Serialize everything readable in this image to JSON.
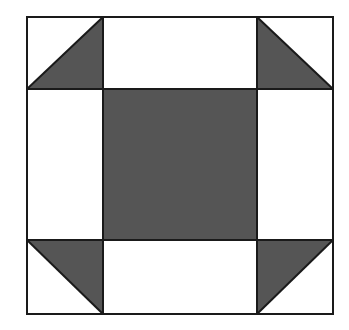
{
  "diagram": {
    "type": "quilt-block",
    "pattern": "shoo-fly",
    "grid": "3x3",
    "colors": {
      "background": "#ffffff",
      "fill": "#555555",
      "stroke": "#1a1a1a"
    },
    "bounds": {
      "left": 27,
      "top": 17,
      "right": 333,
      "bottom": 314
    },
    "columns": [
      27,
      103,
      257,
      333
    ],
    "rows": [
      17,
      89,
      240,
      314
    ],
    "cells": [
      {
        "row": 0,
        "col": 0,
        "kind": "half-square-triangle",
        "shaded_half": "lower-right"
      },
      {
        "row": 0,
        "col": 1,
        "kind": "plain",
        "shade": "white"
      },
      {
        "row": 0,
        "col": 2,
        "kind": "half-square-triangle",
        "shaded_half": "lower-left"
      },
      {
        "row": 1,
        "col": 0,
        "kind": "plain",
        "shade": "white"
      },
      {
        "row": 1,
        "col": 1,
        "kind": "plain",
        "shade": "dark"
      },
      {
        "row": 1,
        "col": 2,
        "kind": "plain",
        "shade": "white"
      },
      {
        "row": 2,
        "col": 0,
        "kind": "half-square-triangle",
        "shaded_half": "upper-right"
      },
      {
        "row": 2,
        "col": 1,
        "kind": "plain",
        "shade": "white"
      },
      {
        "row": 2,
        "col": 2,
        "kind": "half-square-triangle",
        "shaded_half": "upper-left"
      }
    ]
  }
}
